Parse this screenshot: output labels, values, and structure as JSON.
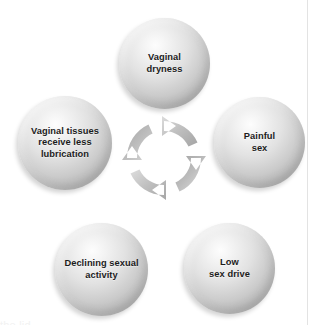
{
  "figure": {
    "type": "cycle-diagram",
    "title": "",
    "background_color": "#ffffff",
    "text_color": "#1c1c1c",
    "node_color": "#cbcbcb",
    "arrow_color": "#b9b9b9",
    "rule_color": "#e3e3e3",
    "caption_sliver": "the lid"
  },
  "center": {
    "icon": "circular-arrows-icon",
    "direction": "clockwise",
    "arrow_count": 4
  },
  "nodes": [
    {
      "id": "vaginal-dryness",
      "label": "Vaginal\ndryness",
      "position": "top"
    },
    {
      "id": "painful-sex",
      "label": "Painful\nsex",
      "position": "right"
    },
    {
      "id": "low-sex-drive",
      "label": "Low\nsex drive",
      "position": "bottom-right"
    },
    {
      "id": "declining-sexual-activity",
      "label": "Declining sexual\nactivity",
      "position": "bottom-left"
    },
    {
      "id": "vaginal-tissues-less-lubrication",
      "label": "Vaginal tissues\nreceive less\nlubrication",
      "position": "left"
    }
  ]
}
